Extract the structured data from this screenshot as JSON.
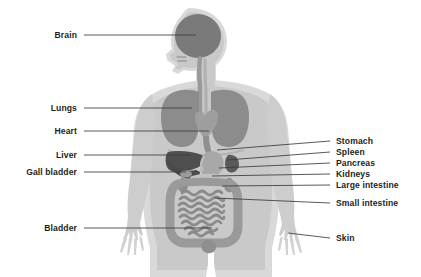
{
  "diagram": {
    "background_color": "#ffffff",
    "label_color": "#231f20",
    "leader_line_color": "#3b3b3b",
    "palette": {
      "body_outline": "#d9d9d9",
      "body_fill": "#c9c9c9",
      "skin_light": "#d6d6d6",
      "brain": "#7a7a7a",
      "lungs": "#8c8c8c",
      "heart": "#9e9e9e",
      "liver": "#4f4f4f",
      "stomach": "#a8a8a8",
      "spleen": "#5a5a5a",
      "pancreas": "#c2c2c2",
      "kidneys": "#8f8f8f",
      "large_intestine": "#9a9a9a",
      "small_intestine": "#8a8a8a",
      "bladder": "#8f8f8f",
      "trachea": "#9a9a9a"
    },
    "labels_left": [
      {
        "id": "brain",
        "text": "Brain",
        "text_x": 77,
        "text_y": 31,
        "line_x1": 84,
        "line_y1": 35,
        "line_x2": 196,
        "line_y2": 35
      },
      {
        "id": "lungs",
        "text": "Lungs",
        "text_x": 77,
        "text_y": 104,
        "line_x1": 84,
        "line_y1": 108,
        "line_x2": 192,
        "line_y2": 108
      },
      {
        "id": "heart",
        "text": "Heart",
        "text_x": 77,
        "text_y": 127,
        "line_x1": 84,
        "line_y1": 131,
        "line_x2": 209,
        "line_y2": 131
      },
      {
        "id": "liver",
        "text": "Liver",
        "text_x": 77,
        "text_y": 151,
        "line_x1": 84,
        "line_y1": 155,
        "line_x2": 190,
        "line_y2": 155
      },
      {
        "id": "gall-bladder",
        "text": "Gall bladder",
        "text_x": 77,
        "text_y": 168,
        "line_x1": 84,
        "line_y1": 172,
        "line_x2": 186,
        "line_y2": 172
      },
      {
        "id": "bladder",
        "text": "Bladder",
        "text_x": 77,
        "text_y": 224,
        "line_x1": 84,
        "line_y1": 228,
        "line_x2": 212,
        "line_y2": 228
      }
    ],
    "labels_right": [
      {
        "id": "stomach",
        "text": "Stomach",
        "text_x": 336,
        "text_y": 137,
        "line_x1": 330,
        "line_y1": 141,
        "line_x2": 217,
        "line_y2": 150
      },
      {
        "id": "spleen",
        "text": "Spleen",
        "text_x": 336,
        "text_y": 148,
        "line_x1": 330,
        "line_y1": 152,
        "line_x2": 227,
        "line_y2": 160
      },
      {
        "id": "pancreas",
        "text": "Pancreas",
        "text_x": 336,
        "text_y": 159,
        "line_x1": 330,
        "line_y1": 163,
        "line_x2": 219,
        "line_y2": 168
      },
      {
        "id": "kidneys",
        "text": "Kidneys",
        "text_x": 336,
        "text_y": 170,
        "line_x1": 330,
        "line_y1": 174,
        "line_x2": 212,
        "line_y2": 176
      },
      {
        "id": "large-intestine",
        "text": "Large intestine",
        "text_x": 336,
        "text_y": 181,
        "line_x1": 330,
        "line_y1": 185,
        "line_x2": 222,
        "line_y2": 186
      },
      {
        "id": "small-intestine",
        "text": "Small intestine",
        "text_x": 336,
        "text_y": 199,
        "line_x1": 330,
        "line_y1": 203,
        "line_x2": 215,
        "line_y2": 198
      },
      {
        "id": "skin",
        "text": "Skin",
        "text_x": 336,
        "text_y": 234,
        "line_x1": 330,
        "line_y1": 238,
        "line_x2": 288,
        "line_y2": 233
      }
    ]
  }
}
